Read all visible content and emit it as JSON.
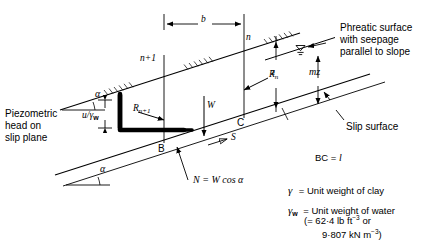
{
  "figure": {
    "type": "infinite-slope-stability-diagram",
    "title_present": false
  },
  "labels": {
    "b": "b",
    "n": "n",
    "n_plus_1": "n+1",
    "R_n": "R",
    "R_n_sub": "n",
    "R_n1": "R",
    "R_n1_sub": "n+1",
    "W": "W",
    "z": "z",
    "mz": "mz",
    "B": "B",
    "C": "C",
    "S": "S",
    "alpha_left": "α",
    "alpha_lower": "α",
    "u_over_gw_num": "u",
    "u_over_gw_den": "γ",
    "u_over_gw_den_sub": "w",
    "N_equals": "N = W cos α"
  },
  "annotations": {
    "piezometric": [
      "Piezometric",
      "head on",
      "slip plane"
    ],
    "phreatic": [
      "Phreatic surface",
      "with seepage",
      "parallel to slope"
    ],
    "slip_surface": "Slip surface",
    "bc_equals": "BC = ",
    "bc_equals_sym": "l"
  },
  "legend": {
    "gamma_sym": "γ",
    "gamma_text": "= Unit weight of clay",
    "gamma_w_sym": "γ",
    "gamma_w_sub": "w",
    "gamma_w_text": "= Unit weight of water",
    "gamma_w_value_line1_pre": "(= 62·4 lb ft",
    "gamma_w_value_line1_sup": "−3",
    "gamma_w_value_line1_post": " or",
    "gamma_w_value_line2_pre": "9·807 kN m",
    "gamma_w_value_line2_sup": "−3",
    "gamma_w_value_line2_post": ")"
  },
  "colors": {
    "ink": "#000000",
    "background": "#ffffff"
  },
  "geometry": {
    "slope_angle_label": "α",
    "slice_width_label": "b",
    "slice_depth_label": "z",
    "water_depth_label": "mz"
  }
}
